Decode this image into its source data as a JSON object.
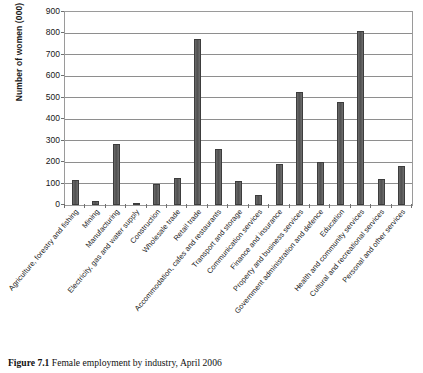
{
  "figure": {
    "caption_label": "Figure 7.1",
    "caption_text": "Female employment by industry, April 2006"
  },
  "axes": {
    "ylabel": "Number of women (000)",
    "xlabel": "",
    "y_ticks": [
      "0",
      "100",
      "200",
      "300",
      "400",
      "500",
      "600",
      "700",
      "800",
      "900"
    ]
  },
  "chart_data": {
    "type": "bar",
    "title": "Female employment by industry, April 2006",
    "xlabel": "",
    "ylabel": "Number of women (000)",
    "ylim": [
      0,
      900
    ],
    "ytick_step": 100,
    "grid": true,
    "legend": false,
    "bar_color": "#5b5b5b",
    "categories": [
      "Agriculture, forestry and fishing",
      "Mining",
      "Manufacturing",
      "Electricity, gas and water supply",
      "Construction",
      "Wholesale trade",
      "Retail trade",
      "Accommodation, cafes and restaurants",
      "Transport and storage",
      "Communication services",
      "Finance and insurance",
      "Property and business services",
      "Government administration and defence",
      "Education",
      "Health and community services",
      "Cultural and recreational services",
      "Personal and other services"
    ],
    "values": [
      115,
      20,
      285,
      10,
      100,
      125,
      775,
      260,
      110,
      45,
      190,
      525,
      200,
      480,
      810,
      120,
      180
    ]
  }
}
